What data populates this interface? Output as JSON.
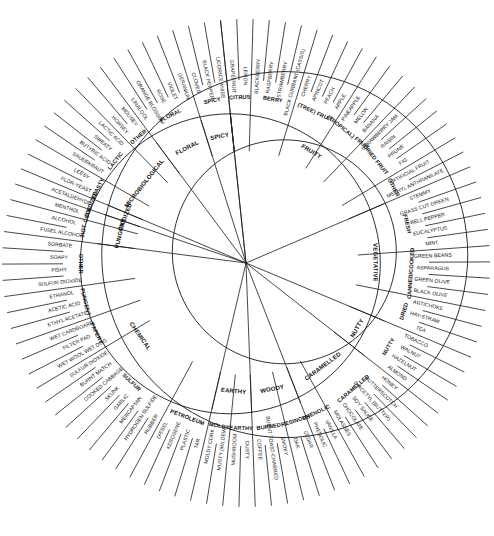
{
  "figure": {
    "name": "wine-aroma-wheel",
    "center": {
      "x": 246,
      "y": 263
    },
    "radii": {
      "r0": 0,
      "r1": 112,
      "r2": 150,
      "r3": 183,
      "r4": 244
    },
    "stroke_color": "#1a1a1a",
    "background": "#ffffff"
  },
  "chart_data": {
    "type": "pie",
    "title": "",
    "legend": "none",
    "grid": false,
    "start_angle_deg": -96,
    "note": "Three concentric rings. Ring 1 = 12 primary classes, Ring 2 = sub-classes, Ring 3 = specific descriptors. Angular width of each primary class is proportional to its number of outer descriptors.",
    "categories": [
      "FRUITY",
      "VEGETATIVE",
      "NUTTY",
      "CARAMELLED",
      "WOODY",
      "EARTHY",
      "CHEMICAL",
      "PUNGENT",
      "OXIDIZED",
      "MICROBIOLOGICAL",
      "FLORAL",
      "SPICY"
    ],
    "values": [
      23,
      11,
      3,
      9,
      6,
      4,
      18,
      3,
      1,
      12,
      4,
      3
    ],
    "ring1": [
      {
        "label": "FRUITY",
        "count": 23
      },
      {
        "label": "VEGETATIVE",
        "count": 11
      },
      {
        "label": "NUTTY",
        "count": 3
      },
      {
        "label": "CARAMELLED",
        "count": 9
      },
      {
        "label": "WOODY",
        "count": 6
      },
      {
        "label": "EARTHY",
        "count": 4
      },
      {
        "label": "CHEMICAL",
        "count": 18
      },
      {
        "label": "PUNGENT",
        "count": 3
      },
      {
        "label": "OXIDIZED",
        "count": 1
      },
      {
        "label": "MICROBIOLOGICAL",
        "count": 12
      },
      {
        "label": "FLORAL",
        "count": 4
      },
      {
        "label": "SPICY",
        "count": 3
      }
    ],
    "ring2": [
      {
        "label": "CITRUS",
        "parent": "FRUITY",
        "count": 2
      },
      {
        "label": "BERRY",
        "parent": "FRUITY",
        "count": 4
      },
      {
        "label": "(TREE) FRUIT",
        "parent": "FRUITY",
        "count": 4
      },
      {
        "label": "(TROPICAL) FRUIT",
        "parent": "FRUITY",
        "count": 3
      },
      {
        "label": "DRIED FRUIT",
        "parent": "FRUITY",
        "count": 4
      },
      {
        "label": "OTHER",
        "parent": "FRUITY",
        "count": 2
      },
      {
        "label": "FRESH",
        "parent": "VEGETATIVE",
        "count": 5
      },
      {
        "label": "CANNED/COOKED",
        "parent": "VEGETATIVE",
        "count": 4
      },
      {
        "label": "DRIED",
        "parent": "VEGETATIVE",
        "count": 2
      },
      {
        "label": "NUTTY",
        "parent": "NUTTY",
        "count": 3
      },
      {
        "label": "CARAMELLED",
        "parent": "CARAMELLED",
        "count": 6
      },
      {
        "label": "PHENOLIC",
        "parent": "CARAMELLED",
        "count": 3
      },
      {
        "label": "PHENOLIC",
        "parent": "WOODY",
        "count": 2
      },
      {
        "label": "RESINOUS",
        "parent": "WOODY",
        "count": 1
      },
      {
        "label": "BURNED",
        "parent": "WOODY",
        "count": 3
      },
      {
        "label": "EARTHY",
        "parent": "EARTHY",
        "count": 2
      },
      {
        "label": "MOLDY",
        "parent": "EARTHY",
        "count": 2
      },
      {
        "label": "PETROLEUM",
        "parent": "CHEMICAL",
        "count": 4
      },
      {
        "label": "SULFUR",
        "parent": "CHEMICAL",
        "count": 7
      },
      {
        "label": "PAPERY",
        "parent": "CHEMICAL",
        "count": 2
      },
      {
        "label": "PUNGENT",
        "parent": "CHEMICAL",
        "count": 3
      },
      {
        "label": "OTHER",
        "parent": "CHEMICAL",
        "count": 4
      },
      {
        "label": "HOT",
        "parent": "PUNGENT",
        "count": 1
      },
      {
        "label": "COOL",
        "parent": "PUNGENT",
        "count": 1
      },
      {
        "label": "OXIDIZED",
        "parent": "OXIDIZED",
        "count": 1
      },
      {
        "label": "YEASTY",
        "parent": "MICROBIOLOGICAL",
        "count": 2
      },
      {
        "label": "LACTIC",
        "parent": "MICROBIOLOGICAL",
        "count": 4
      },
      {
        "label": "OTHER",
        "parent": "MICROBIOLOGICAL",
        "count": 2
      },
      {
        "label": "FLORAL",
        "parent": "FLORAL",
        "count": 4
      },
      {
        "label": "SPICY",
        "parent": "SPICY",
        "count": 3
      }
    ],
    "ring3": [
      "GRAPEFRUIT",
      "LEMON",
      "BLACKBERRY",
      "RASPBERRY",
      "STRAWBERRY",
      "BLACK CURRANT (CASSIS)",
      "CHERRY",
      "APRICOT",
      "PEACH",
      "APPLE",
      "PINEAPPLE",
      "MELON",
      "BANANA",
      "STRAWBERRY JAM",
      "RAISIN",
      "PRUNE",
      "FIG",
      "ARTIFICIAL FRUIT",
      "METHYL ANTHRANILATE",
      "STEMMY",
      "GRASS CUT GREEN",
      "BELL PEPPER",
      "EUCALYPTUS",
      "MINT",
      "GREEN BEANS",
      "ASPARAGUS",
      "GREEN OLIVE",
      "BLACK OLIVE",
      "ARTICHOKE",
      "HAY-STRAW",
      "TEA",
      "TOBACCO",
      "WALNUT",
      "HAZELNUT",
      "ALMOND",
      "HONEY",
      "BUTTERSCOTCH",
      "DIACETYL (BUTTER)",
      "SOY SAUCE",
      "CHOCOLATE",
      "MOLASSES",
      "VANILLA",
      "PHENOLIC",
      "CEDAR",
      "OAK",
      "SMOKY",
      "BURNT TOAST-CHARRED",
      "COFFEE",
      "DUSTY",
      "MUSHROOM",
      "MUSTY (MILDEW)",
      "MOLDY CORK",
      "TAR",
      "PLASTIC",
      "KEROSENE",
      "DIESEL",
      "RUBBER",
      "HYDROGEN SULFIDE",
      "MERCAPTAN",
      "GARLIC",
      "SKUNK",
      "COOKED CABBAGE",
      "BURNT MATCH",
      "SULFUR DIOXIDE",
      "WET WOOL WET DOG",
      "FILTER PAD",
      "WET CARDBOARD",
      "ETHYL ACETATE",
      "ACETIC ACID",
      "ETHANOL",
      "SULFUR DIOXIDE",
      "FISHY",
      "SOAPY",
      "SORBATE",
      "FUSEL ALCOHOL",
      "ALCOHOL",
      "MENTHOL",
      "ACETALDEHYDE",
      "FLOR-YEAST",
      "LEESY",
      "SAUERKRAUT",
      "BUTYRIC ACID",
      "SWEATY",
      "LACTIC ACID",
      "HORSEY",
      "MOUSEY",
      "LINALOOL",
      "ORANGE BLOSSOM",
      "ROSE",
      "VIOLET",
      "GERANIUM",
      "CLOVES",
      "BLACK PEPPER",
      "LICORICE ANISE"
    ],
    "segments": [
      {
        "l1": "FRUITY",
        "children": [
          {
            "l2": "CITRUS",
            "l3": [
              "GRAPEFRUIT",
              "LEMON"
            ]
          },
          {
            "l2": "BERRY",
            "l3": [
              "BLACKBERRY",
              "RASPBERRY",
              "STRAWBERRY",
              "BLACK CURRANT (CASSIS)"
            ]
          },
          {
            "l2": "(TREE) FRUIT",
            "l3": [
              "CHERRY",
              "APRICOT",
              "PEACH",
              "APPLE"
            ]
          },
          {
            "l2": "(TROPICAL) FRUIT",
            "l3": [
              "PINEAPPLE",
              "MELON",
              "BANANA"
            ]
          },
          {
            "l2": "DRIED FRUIT",
            "l3": [
              "STRAWBERRY JAM",
              "RAISIN",
              "PRUNE",
              "FIG"
            ]
          },
          {
            "l2": "OTHER",
            "l3": [
              "ARTIFICIAL FRUIT",
              "METHYL ANTHRANILATE"
            ]
          }
        ]
      },
      {
        "l1": "VEGETATIVE",
        "children": [
          {
            "l2": "FRESH",
            "l3": [
              "STEMMY",
              "GRASS CUT GREEN",
              "BELL PEPPER",
              "EUCALYPTUS",
              "MINT"
            ]
          },
          {
            "l2": "CANNED/COOKED",
            "l3": [
              "GREEN BEANS",
              "ASPARAGUS",
              "GREEN OLIVE",
              "BLACK OLIVE"
            ]
          },
          {
            "l2": "DRIED",
            "l3": [
              "ARTICHOKE",
              "HAY-STRAW",
              "TEA"
            ]
          }
        ]
      },
      {
        "l1": "NUTTY",
        "children": [
          {
            "l2": "NUTTY",
            "l3": [
              "TOBACCO",
              "WALNUT",
              "HAZELNUT",
              "ALMOND"
            ]
          }
        ]
      },
      {
        "l1": "CARAMELLED",
        "children": [
          {
            "l2": "CARAMELLED",
            "l3": [
              "HONEY",
              "BUTTERSCOTCH",
              "DIACETYL (BUTTER)",
              "SOY SAUCE",
              "CHOCOLATE",
              "MOLASSES"
            ]
          },
          {
            "l2": "PHENOLIC",
            "l3": [
              "VANILLA",
              "PHENOLIC"
            ]
          }
        ]
      },
      {
        "l1": "WOODY",
        "children": [
          {
            "l2": "RESINOUS",
            "l3": [
              "CEDAR",
              "OAK"
            ]
          },
          {
            "l2": "BURNED",
            "l3": [
              "SMOKY",
              "BURNT TOAST-CHARRED",
              "COFFEE"
            ]
          }
        ]
      },
      {
        "l1": "EARTHY",
        "children": [
          {
            "l2": "EARTHY",
            "l3": [
              "DUSTY",
              "MUSHROOM"
            ]
          },
          {
            "l2": "MOLDY",
            "l3": [
              "MUSTY (MILDEW)",
              "MOLDY CORK"
            ]
          }
        ]
      },
      {
        "l1": "CHEMICAL",
        "children": [
          {
            "l2": "PETROLEUM",
            "l3": [
              "TAR",
              "PLASTIC",
              "KEROSENE",
              "DIESEL"
            ]
          },
          {
            "l2": "SULFUR",
            "l3": [
              "RUBBER",
              "HYDROGEN SULFIDE",
              "MERCAPTAN",
              "GARLIC",
              "SKUNK",
              "COOKED CABBAGE",
              "BURNT MATCH",
              "SULFUR DIOXIDE"
            ]
          },
          {
            "l2": "PAPERY",
            "l3": [
              "WET WOOL WET DOG",
              "FILTER PAD",
              "WET CARDBOARD"
            ]
          },
          {
            "l2": "PUNGENT",
            "l3": [
              "ETHYL ACETATE",
              "ACETIC ACID",
              "ETHANOL"
            ]
          },
          {
            "l2": "OTHER",
            "l3": [
              "SULFUR DIOXIDE",
              "FISHY",
              "SOAPY",
              "SORBATE"
            ]
          }
        ]
      },
      {
        "l1": "PUNGENT",
        "children": [
          {
            "l2": "HOT",
            "l3": [
              "FUSEL ALCOHOL",
              "ALCOHOL"
            ]
          },
          {
            "l2": "COOL",
            "l3": [
              "MENTHOL"
            ]
          }
        ]
      },
      {
        "l1": "OXIDIZED",
        "children": [
          {
            "l2": "OXIDIZED",
            "l3": [
              "ACETALDEHYDE"
            ]
          }
        ]
      },
      {
        "l1": "MICROBIOLOGICAL",
        "children": [
          {
            "l2": "YEASTY",
            "l3": [
              "FLOR-YEAST",
              "LEESY"
            ]
          },
          {
            "l2": "LACTIC",
            "l3": [
              "SAUERKRAUT",
              "BUTYRIC ACID",
              "SWEATY",
              "LACTIC ACID"
            ]
          },
          {
            "l2": "OTHER",
            "l3": [
              "HORSEY",
              "MOUSEY"
            ]
          }
        ]
      },
      {
        "l1": "FLORAL",
        "children": [
          {
            "l2": "FLORAL",
            "l3": [
              "LINALOOL",
              "ORANGE BLOSSOM",
              "ROSE",
              "VIOLET",
              "GERANIUM"
            ]
          }
        ]
      },
      {
        "l1": "SPICY",
        "children": [
          {
            "l2": "SPICY",
            "l3": [
              "CLOVES",
              "BLACK PEPPER",
              "LICORICE ANISE"
            ]
          }
        ]
      }
    ]
  }
}
